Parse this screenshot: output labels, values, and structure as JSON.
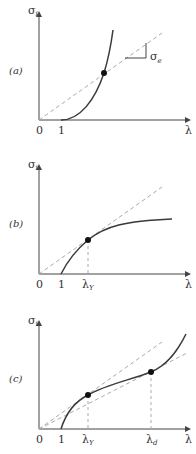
{
  "figure": {
    "panels": [
      {
        "id": "a",
        "panel_label": "(a)",
        "y_axis_label": "σ",
        "y_axis_sub": "i",
        "x_axis_label": "λ",
        "x_ticks": [
          "0",
          "1"
        ],
        "slope_label": "σ",
        "slope_sub": "e"
      },
      {
        "id": "b",
        "panel_label": "(b)",
        "y_axis_label": "σ",
        "y_axis_sub": "i",
        "x_axis_label": "λ",
        "x_ticks": [
          "0",
          "1",
          "λ"
        ],
        "x_tick_subs": [
          "",
          "",
          "Y"
        ]
      },
      {
        "id": "c",
        "panel_label": "(c)",
        "y_axis_label": "σ",
        "y_axis_sub": "i",
        "x_axis_label": "λ",
        "x_ticks": [
          "0",
          "1",
          "λ",
          "λ"
        ],
        "x_tick_subs": [
          "",
          "",
          "Y",
          "d"
        ]
      }
    ],
    "colors": {
      "axis": "#444444",
      "curve": "#3a3a3a",
      "dashed": "#aaaaaa",
      "point": "#111111"
    }
  }
}
